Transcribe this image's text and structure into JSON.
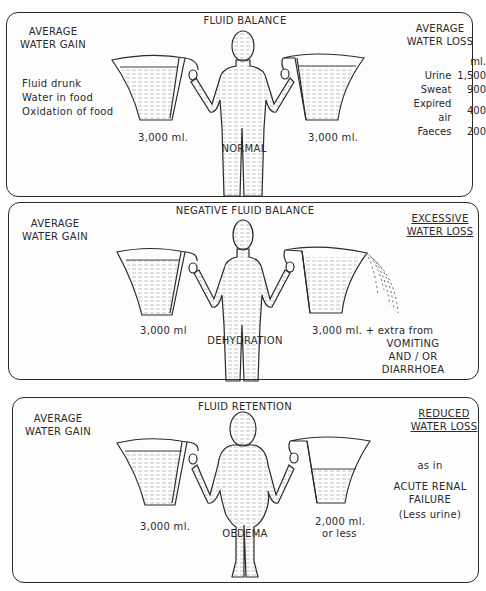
{
  "panels": [
    {
      "id": "fluid-balance",
      "title": "FLUID BALANCE",
      "gain_heading": "AVERAGE\nWATER GAIN",
      "gain_sources": [
        "Fluid drunk",
        "Water in food",
        "Oxidation of food"
      ],
      "gain_amount": "3,000 ml.",
      "figure_label": "NORMAL",
      "loss_heading": "AVERAGE\nWATER LOSS",
      "loss_unit": "ml.",
      "loss_items": [
        {
          "label": "Urine",
          "value": "1,500"
        },
        {
          "label": "Sweat",
          "value": "900"
        },
        {
          "label": "Expired air",
          "value": "400"
        },
        {
          "label": "Faeces",
          "value": "200"
        }
      ],
      "loss_amount": "3,000 ml."
    },
    {
      "id": "negative-fluid-balance",
      "title": "NEGATIVE FLUID BALANCE",
      "gain_heading": "AVERAGE\nWATER GAIN",
      "gain_amount": "3,000 ml",
      "figure_label": "DEHYDRATION",
      "loss_heading": "EXCESSIVE\nWATER LOSS",
      "loss_amount": "3,000 ml. + extra from",
      "loss_causes": [
        "VOMITING",
        "AND / OR",
        "DIARRHOEA"
      ]
    },
    {
      "id": "fluid-retention",
      "title": "FLUID RETENTION",
      "gain_heading": "AVERAGE\nWATER GAIN",
      "gain_amount": "3,000 ml.",
      "figure_label": "OEDEMA",
      "loss_heading": "REDUCED\nWATER LOSS",
      "loss_amount_line1": "2,000 ml.",
      "loss_amount_line2": "or less",
      "condition_prefix": "as in",
      "condition": "ACUTE RENAL\nFAILURE",
      "condition_note": "(Less urine)"
    }
  ],
  "colors": {
    "ink": "#2a2a2a",
    "water_lines": "#9a9a9a",
    "paper": "#fdfdfd"
  }
}
